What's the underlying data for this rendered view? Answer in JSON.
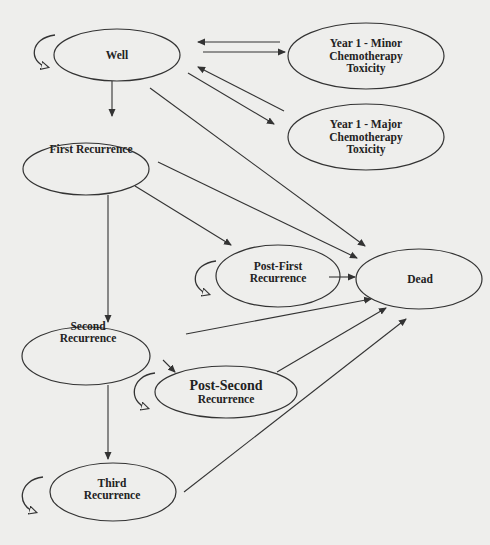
{
  "diagram": {
    "type": "state-transition (Markov model)",
    "colors": {
      "background": "#eeeeec",
      "stroke": "#333333",
      "text": "#222222"
    },
    "nodes": [
      {
        "id": "well",
        "lines": [
          "Well"
        ]
      },
      {
        "id": "minor",
        "lines": [
          "Year 1 - Minor",
          "Chemotherapy",
          "Toxicity"
        ]
      },
      {
        "id": "major",
        "lines": [
          "Year 1 - Major",
          "Chemotherapy",
          "Toxicity"
        ]
      },
      {
        "id": "first",
        "lines": [
          "First Recurrence"
        ]
      },
      {
        "id": "postfirst",
        "lines": [
          "Post-First",
          "Recurrence"
        ]
      },
      {
        "id": "dead",
        "lines": [
          "Dead"
        ]
      },
      {
        "id": "second",
        "lines": [
          "Second",
          "Recurrence"
        ]
      },
      {
        "id": "postsecond",
        "lines": [
          "Post-Second",
          "Recurrence"
        ]
      },
      {
        "id": "third",
        "lines": [
          "Third",
          "Recurrence"
        ]
      }
    ],
    "edges": [
      {
        "from": "Well",
        "to": "Year 1 - Minor Chemotherapy Toxicity"
      },
      {
        "from": "Year 1 - Minor Chemotherapy Toxicity",
        "to": "Well"
      },
      {
        "from": "Well",
        "to": "Year 1 - Major Chemotherapy Toxicity"
      },
      {
        "from": "Year 1 - Major Chemotherapy Toxicity",
        "to": "Well"
      },
      {
        "from": "Well",
        "to": "First Recurrence"
      },
      {
        "from": "Well",
        "to": "Dead"
      },
      {
        "from": "First Recurrence",
        "to": "Post-First Recurrence"
      },
      {
        "from": "First Recurrence",
        "to": "Dead"
      },
      {
        "from": "First Recurrence",
        "to": "Second Recurrence"
      },
      {
        "from": "Post-First Recurrence",
        "to": "Dead"
      },
      {
        "from": "Second Recurrence",
        "to": "Post-Second Recurrence"
      },
      {
        "from": "Second Recurrence",
        "to": "Dead"
      },
      {
        "from": "Second Recurrence",
        "to": "Third Recurrence"
      },
      {
        "from": "Post-Second Recurrence",
        "to": "Dead"
      },
      {
        "from": "Third Recurrence",
        "to": "Dead"
      }
    ],
    "self_loops": [
      "Well",
      "Post-First Recurrence",
      "Post-Second Recurrence",
      "Third Recurrence"
    ]
  }
}
